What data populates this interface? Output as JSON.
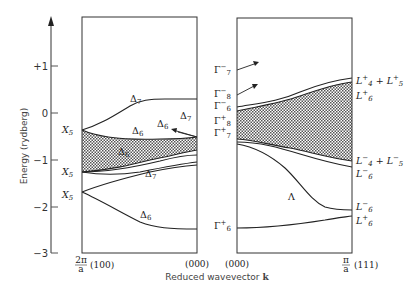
{
  "figure": {
    "y_axis": {
      "title": "Energy (rydberg)",
      "ticks": [
        "+1",
        "0",
        "−1",
        "−2",
        "−3"
      ]
    },
    "x_axis": {
      "title_prefix": "Reduced wavevector ",
      "title_bold": "k",
      "left_start_frac_num": "2π",
      "left_start_frac_den": "a",
      "left_start": "(100)",
      "left_end": "(000)",
      "right_start": "(000)",
      "right_end_frac_num": "π",
      "right_end_frac_den": "a",
      "right_end": "(111)"
    },
    "left_panel": {
      "direction": "Δ",
      "edge_labels": [
        {
          "base": "X",
          "sub": "5"
        },
        {
          "base": "X",
          "sub": "5"
        },
        {
          "base": "X",
          "sub": "5"
        }
      ],
      "band_labels": [
        {
          "base": "Δ",
          "sub": "7"
        },
        {
          "base": "Δ",
          "sub": "6"
        },
        {
          "base": "Δ",
          "sub": "7"
        },
        {
          "base": "Δ",
          "sub": "6"
        },
        {
          "base": "Δ",
          "sub": "6"
        },
        {
          "base": "Δ",
          "sub": "7"
        },
        {
          "base": "Δ",
          "sub": "6"
        }
      ]
    },
    "gamma_labels": [
      {
        "base": "Γ",
        "sup": "−",
        "sub": "7"
      },
      {
        "base": "Γ",
        "sup": "−",
        "sub": "8"
      },
      {
        "base": "Γ",
        "sup": "−",
        "sub": "6"
      },
      {
        "base": "Γ",
        "sup": "+",
        "sub": "8"
      },
      {
        "base": "Γ",
        "sup": "+",
        "sub": "7"
      },
      {
        "base": "Γ",
        "sup": "+",
        "sub": "6"
      }
    ],
    "right_panel": {
      "direction": "Λ",
      "l_labels": [
        {
          "text": "L⁺₄ + L⁺₅",
          "a_sup": "+",
          "a_sub": "4",
          "b_sup": "+",
          "b_sub": "5"
        },
        {
          "a_sup": "+",
          "a_sub": "6"
        },
        {
          "a_sup": "−",
          "a_sub": "4",
          "b_sup": "−",
          "b_sub": "5"
        },
        {
          "a_sup": "−",
          "a_sub": "6"
        },
        {
          "a_sup": "−",
          "a_sub": "6"
        },
        {
          "a_sup": "+",
          "a_sub": "6"
        }
      ]
    }
  }
}
